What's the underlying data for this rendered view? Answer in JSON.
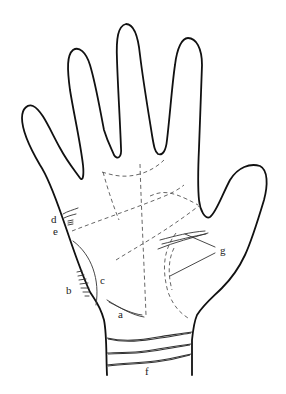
{
  "figure": {
    "colors": {
      "line": "#111111",
      "background": "#ffffff"
    },
    "labels": {
      "a": "a",
      "b": "b",
      "c": "c",
      "d": "d",
      "e": "e",
      "f": "f",
      "g": "g"
    }
  }
}
